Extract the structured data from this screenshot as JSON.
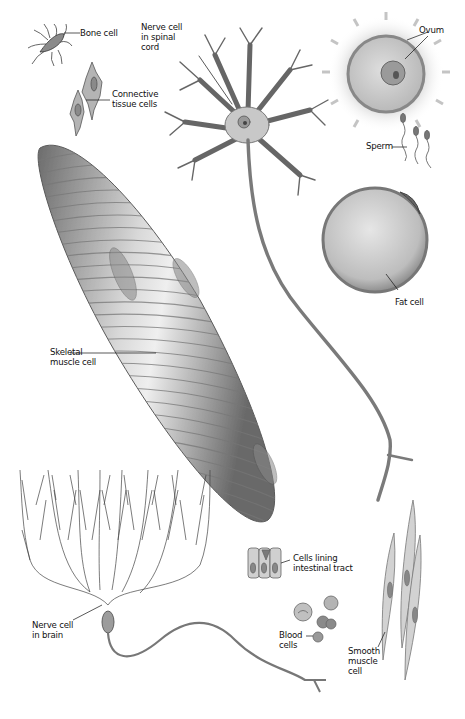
{
  "figure": {
    "background": "#ffffff",
    "ink_color": "#1a1a1a",
    "cell_fill": "#c9c9c9"
  },
  "labels": {
    "bone_cell": {
      "line1": "Bone cell"
    },
    "connective_tissue": {
      "line1": "Connective",
      "line2": "tissue cells"
    },
    "nerve_spinal": {
      "line1": "Nerve cell",
      "line2": "in spinal",
      "line3": "cord"
    },
    "ovum": {
      "line1": "Ovum"
    },
    "sperm": {
      "line1": "Sperm"
    },
    "fat_cell": {
      "line1": "Fat cell"
    },
    "skeletal_muscle": {
      "line1": "Skeletal",
      "line2": "muscle cell"
    },
    "intestinal": {
      "line1": "Cells lining",
      "line2": "intestinal tract"
    },
    "nerve_brain": {
      "line1": "Nerve cell",
      "line2": "in brain"
    },
    "blood": {
      "line1": "Blood",
      "line2": "cells"
    },
    "smooth_muscle": {
      "line1": "Smooth",
      "line2": "muscle",
      "line3": "cell"
    }
  }
}
